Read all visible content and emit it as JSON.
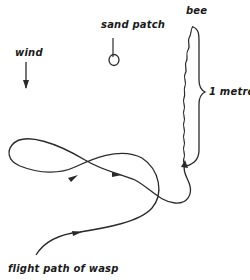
{
  "diagram": {
    "labels": {
      "bee": "bee",
      "sand_patch": "sand patch",
      "wind": "wind",
      "distance": "1 metre",
      "flight_path": "flight path of wasp"
    },
    "colors": {
      "stroke": "#2a2a2a",
      "background": "#ffffff"
    },
    "icons": {
      "wind_direction": "down-arrow-icon",
      "sand_patch_marker": "circle-icon",
      "distance_brace": "right-brace-icon"
    }
  }
}
